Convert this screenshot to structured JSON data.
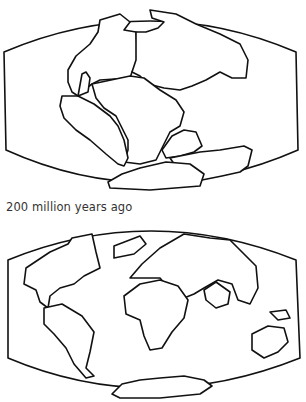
{
  "figures": [
    {
      "id": "pangaea-map",
      "description": "World map outline showing supercontinent Pangaea"
    },
    {
      "id": "modern-map",
      "description": "World map outline showing present-day continents"
    }
  ],
  "caption": "200 million years ago"
}
